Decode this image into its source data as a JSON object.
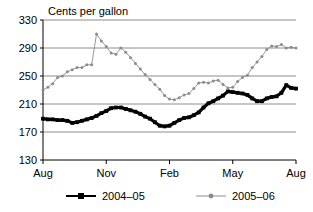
{
  "chart_data": {
    "type": "line",
    "title": "Cents per gallon",
    "xlabel": "",
    "ylabel": "",
    "ylim": [
      130,
      330
    ],
    "yticks": [
      130,
      170,
      210,
      250,
      290,
      330
    ],
    "ytick_labels": [
      "130",
      "170",
      "210",
      "250",
      "290",
      "330"
    ],
    "xtick_labels": [
      "Aug",
      "Nov",
      "Feb",
      "May",
      "Aug"
    ],
    "xtick_positions": [
      0,
      13,
      26,
      39,
      52
    ],
    "grid": true,
    "grid_axis": "y",
    "legend_position": "bottom",
    "x_count": 53,
    "series": [
      {
        "name": "2004–05",
        "color": "#000000",
        "marker": "square",
        "values": [
          189,
          188,
          188,
          187,
          187,
          186,
          183,
          184,
          186,
          188,
          190,
          193,
          197,
          200,
          204,
          205,
          205,
          203,
          201,
          199,
          196,
          192,
          189,
          184,
          179,
          178,
          179,
          183,
          187,
          190,
          191,
          194,
          198,
          205,
          211,
          214,
          218,
          222,
          228,
          227,
          226,
          225,
          223,
          218,
          214,
          214,
          218,
          220,
          221,
          226,
          237,
          233,
          232
        ]
      },
      {
        "name": "2005–06",
        "color": "#8c8c8c",
        "marker": "circle",
        "values": [
          230,
          234,
          239,
          248,
          250,
          256,
          259,
          262,
          262,
          266,
          266,
          310,
          300,
          292,
          283,
          281,
          290,
          284,
          276,
          268,
          260,
          252,
          245,
          238,
          231,
          222,
          217,
          216,
          219,
          223,
          225,
          232,
          240,
          241,
          240,
          243,
          244,
          238,
          233,
          234,
          242,
          248,
          251,
          262,
          270,
          278,
          288,
          293,
          292,
          295,
          290,
          291,
          290,
          290,
          293,
          297,
          299,
          301,
          302
        ]
      }
    ]
  },
  "legend": {
    "entries": [
      {
        "label": "2004–05"
      },
      {
        "label": "2005–06"
      }
    ]
  }
}
